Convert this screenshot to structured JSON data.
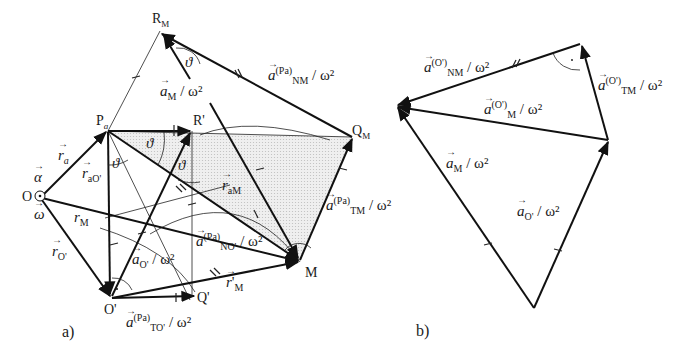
{
  "figure": {
    "panels": [
      {
        "id": "a",
        "caption": "a)",
        "points": {
          "O": "O",
          "Pa": "P",
          "Pa_sub": "a",
          "RM": "R",
          "RM_sub": "M",
          "Rprime": "R'",
          "QM": "Q",
          "QM_sub": "M",
          "M": "M",
          "Oprime": "O'",
          "Qprime": "Q'"
        },
        "vectors": {
          "alpha": "α",
          "omega": "ω",
          "r_a": {
            "sym": "r",
            "sub": "a"
          },
          "r_aO": {
            "sym": "r",
            "sub": "aO'"
          },
          "r_M": {
            "sym": "r",
            "sub": "M"
          },
          "r_O": {
            "sym": "r",
            "sub": "O'"
          },
          "r_aM": {
            "sym": "r",
            "sub": "aM"
          },
          "r_prime_M": {
            "sym": "r",
            "prime": "'",
            "sub": "M"
          },
          "a_M": {
            "sym": "a",
            "sub": "M",
            "tail": " / ω²"
          },
          "a_O": {
            "sym": "a",
            "sub": "O'",
            "tail": " / ω²"
          },
          "a_NM_Pa": {
            "sym": "a",
            "sup": "(Pa)",
            "sub": "NM",
            "tail": " / ω²"
          },
          "a_TM_Pa": {
            "sym": "a",
            "sup": "(Pa)",
            "sub": "TM",
            "tail": " / ω²"
          },
          "a_NO_Pa": {
            "sym": "a",
            "sup": "(Pa)",
            "sub": "NO'",
            "tail": " / ω²"
          },
          "a_TO_Pa": {
            "sym": "a",
            "sup": "(Pa)",
            "sub": "TO'",
            "tail": " / ω²"
          }
        },
        "angle_label": "ϑ"
      },
      {
        "id": "b",
        "caption": "b)",
        "vectors": {
          "a_NM_O": {
            "sym": "a",
            "sup": "(O')",
            "sub": "NM",
            "tail": " / ω²"
          },
          "a_TM_O": {
            "sym": "a",
            "sup": "(O')",
            "sub": "TM",
            "tail": " / ω²"
          },
          "a_M_O": {
            "sym": "a",
            "sup": "(O')",
            "sub": "M",
            "tail": " / ω²"
          },
          "a_M": {
            "sym": "a",
            "sub": "M",
            "tail": " / ω²"
          },
          "a_O": {
            "sym": "a",
            "sub": "O'",
            "tail": " / ω²"
          }
        }
      }
    ],
    "colors": {
      "ink": "#111111",
      "shade": "#e6e6e6",
      "background": "#ffffff"
    }
  }
}
